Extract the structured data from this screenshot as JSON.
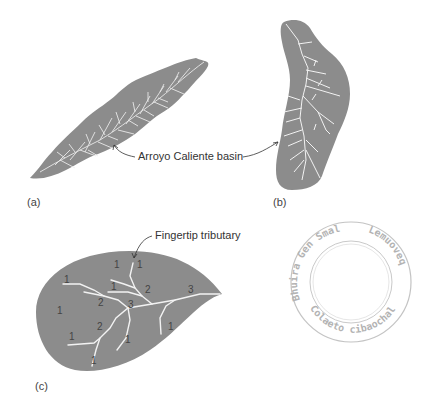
{
  "figure": {
    "colors": {
      "basin_fill": "#8c8c8c",
      "stream": "#f2f2f2",
      "text": "#333333",
      "stamp": "#a8a8a8"
    },
    "panels": [
      {
        "id": "a",
        "label": "(a)"
      },
      {
        "id": "b",
        "label": "(b)"
      },
      {
        "id": "c",
        "label": "(c)"
      }
    ],
    "annotations": {
      "basin_label": "Arroyo Caliente basin",
      "fingertip_label": "Fingertip tributary"
    },
    "stream_orders": [
      {
        "value": "1",
        "x": 117,
        "y": 267
      },
      {
        "value": "1",
        "x": 136,
        "y": 264
      },
      {
        "value": "1",
        "x": 66,
        "y": 280
      },
      {
        "value": "1",
        "x": 112,
        "y": 287
      },
      {
        "value": "2",
        "x": 146,
        "y": 290
      },
      {
        "value": "1",
        "x": 59,
        "y": 312
      },
      {
        "value": "2",
        "x": 99,
        "y": 305
      },
      {
        "value": "3",
        "x": 129,
        "y": 306
      },
      {
        "value": "3",
        "x": 190,
        "y": 292
      },
      {
        "value": "2",
        "x": 99,
        "y": 328
      },
      {
        "value": "1",
        "x": 70,
        "y": 338
      },
      {
        "value": "1",
        "x": 126,
        "y": 341
      },
      {
        "value": "1",
        "x": 170,
        "y": 327
      },
      {
        "value": "1",
        "x": 93,
        "y": 361
      }
    ],
    "stamp": {
      "top_text": "Bhuira Gen Smal",
      "right_text": "Lemuoveq",
      "bottom_text": "Colaeto cibaochals"
    }
  }
}
